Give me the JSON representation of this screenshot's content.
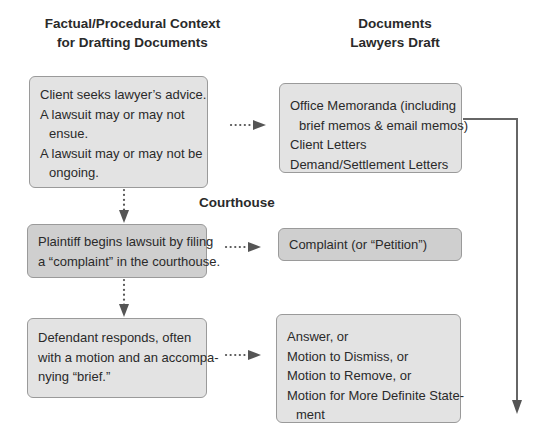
{
  "headers": {
    "left": [
      "Factual/Procedural Context",
      "for Drafting Documents"
    ],
    "right": [
      "Documents",
      "Lawyers Draft"
    ]
  },
  "section_label": "Courthouse",
  "context_boxes": [
    {
      "lines": [
        "Client seeks lawyer’s advice.",
        "A lawsuit may or may not",
        "ensue.",
        "A lawsuit may or may not be",
        "ongoing."
      ]
    },
    {
      "lines": [
        "Plaintiff begins lawsuit by filing",
        "a “complaint” in the courthouse."
      ]
    },
    {
      "lines": [
        "Defendant responds, often",
        "with a motion and an accompa-",
        "nying “brief.”"
      ]
    }
  ],
  "document_boxes": [
    {
      "lines": [
        "Office Memoranda (including",
        "brief memos & email memos)",
        "Client Letters",
        "Demand/Settlement Letters"
      ]
    },
    {
      "lines": [
        "Complaint (or “Petition”)"
      ]
    },
    {
      "lines": [
        "Answer, or",
        "Motion to Dismiss, or",
        "Motion to Remove, or",
        "Motion for More Definite State-",
        "ment"
      ]
    }
  ],
  "colors": {
    "box_light": "#e3e3e3",
    "box_dark": "#cfcfcf",
    "arrow": "#555555",
    "flow_line": "#666666"
  }
}
